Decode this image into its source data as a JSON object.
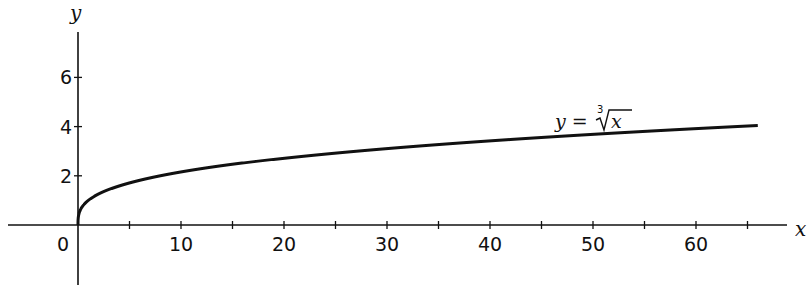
{
  "chart_data": {
    "type": "line",
    "title": "",
    "xlabel": "x",
    "ylabel": "y",
    "function": "y = cube_root(x)",
    "annotation": "y = ∛x",
    "xlim": [
      -7,
      69
    ],
    "ylim": [
      -2.4,
      7.6
    ],
    "xticks_major": [
      10,
      20,
      30,
      40,
      50,
      60
    ],
    "xticks_minor": [
      5,
      15,
      25,
      35,
      45,
      55,
      65
    ],
    "yticks": [
      2,
      4,
      6
    ],
    "origin_label": "0",
    "grid": false,
    "legend": "none",
    "series": [
      {
        "name": "y = ∛x",
        "x": [
          0,
          0.1,
          0.5,
          1,
          2,
          4,
          8,
          12,
          16,
          20,
          27,
          32,
          40,
          48,
          56,
          64,
          66
        ],
        "y": [
          0,
          0.46,
          0.79,
          1,
          1.26,
          1.59,
          2,
          2.29,
          2.52,
          2.71,
          3,
          3.17,
          3.42,
          3.63,
          3.83,
          4,
          4.04
        ]
      }
    ]
  },
  "labels": {
    "x_axis": "x",
    "y_axis": "y",
    "origin": "0",
    "x_ticks": [
      "10",
      "20",
      "30",
      "40",
      "50",
      "60"
    ],
    "y_ticks": [
      "2",
      "4",
      "6"
    ],
    "equation_lhs": "y =",
    "equation_index": "3",
    "equation_radicand": "x"
  }
}
